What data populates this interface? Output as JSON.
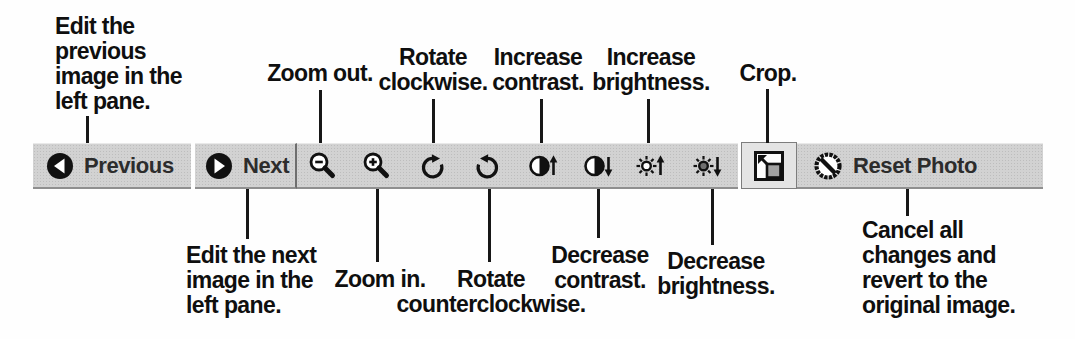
{
  "toolbar": {
    "previous": {
      "label": "Previous"
    },
    "next": {
      "label": "Next"
    },
    "reset": {
      "label": "Reset Photo"
    },
    "icon_names": [
      "previous-circle-arrow-icon",
      "next-circle-arrow-icon",
      "zoom-out-icon",
      "zoom-in-icon",
      "rotate-clockwise-icon",
      "rotate-counterclockwise-icon",
      "increase-contrast-icon",
      "decrease-contrast-icon",
      "increase-brightness-icon",
      "decrease-brightness-icon",
      "crop-icon",
      "reset-prohibition-icon"
    ]
  },
  "callouts": {
    "top": {
      "edit_previous": "Edit the\nprevious\nimage in the\nleft pane.",
      "zoom_out": "Zoom out.",
      "rotate_clockwise": "Rotate\nclockwise.",
      "increase_contrast": "Increase\ncontrast.",
      "increase_brightness": "Increase\nbrightness.",
      "crop": "Crop."
    },
    "bottom": {
      "edit_next": "Edit the next\nimage in the\nleft pane.",
      "zoom_in": "Zoom in.",
      "rotate_counterclockwise": "Rotate\ncounterclockwise.",
      "decrease_contrast": "Decrease\ncontrast.",
      "decrease_brightness": "Decrease\nbrightness.",
      "cancel_reset": "Cancel all\nchanges and\nrevert to the\noriginal image."
    }
  },
  "colors": {
    "toolbar_background": "#d2d2d2",
    "crop_button_background": "#e4e4e4",
    "icon_color": "#111111",
    "text_color": "#2c2c2c",
    "callout_color": "#0f0f0f"
  }
}
